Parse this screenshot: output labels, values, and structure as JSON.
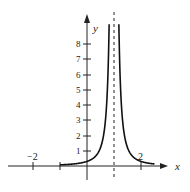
{
  "chart_data": {
    "type": "line",
    "title": "",
    "xlabel": "x",
    "ylabel": "y",
    "xlim": [
      -3,
      3
    ],
    "ylim": [
      -1,
      10
    ],
    "x_ticks": [
      -2,
      -1,
      1,
      2
    ],
    "x_tick_labels": [
      "−2",
      "2"
    ],
    "y_ticks": [
      1,
      2,
      3,
      4,
      5,
      6,
      7,
      8
    ],
    "y_tick_labels": [
      "1",
      "2",
      "3",
      "4",
      "5",
      "6",
      "7",
      "8"
    ],
    "grid": false,
    "legend": null,
    "annotations": [
      "vertical asymptote (dashed) at x = 1"
    ],
    "asymptote_x": 1,
    "curve_start_x": -1,
    "curve_end_x": 2.5,
    "series": [
      {
        "name": "f(x)",
        "function": "0.3/(x-1)^2",
        "points": [
          [
            -1,
            0.08
          ],
          [
            -0.5,
            0.13
          ],
          [
            0,
            0.3
          ],
          [
            0.5,
            1.2
          ],
          [
            0.7,
            3.3
          ],
          [
            0.8,
            7.5
          ],
          [
            1.2,
            7.5
          ],
          [
            1.3,
            3.3
          ],
          [
            1.5,
            1.2
          ],
          [
            2,
            0.3
          ],
          [
            2.5,
            0.13
          ]
        ]
      }
    ]
  },
  "labels": {
    "x_axis": "x",
    "y_axis": "y",
    "x_neg2": "−2",
    "x_pos2": "2",
    "y1": "1",
    "y2": "2",
    "y3": "3",
    "y4": "4",
    "y5": "5",
    "y6": "6",
    "y7": "7",
    "y8": "8"
  }
}
